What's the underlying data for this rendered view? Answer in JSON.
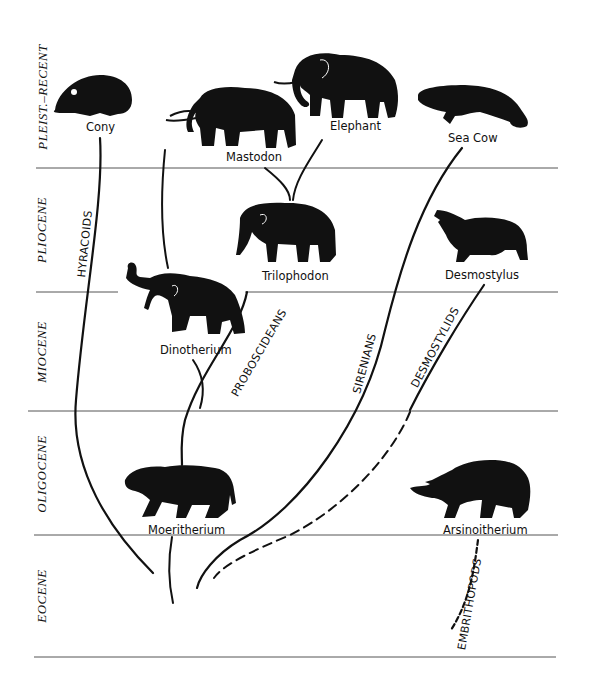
{
  "eras": [
    {
      "label": "PLEIST.–RECENT"
    },
    {
      "label": "PLIOCENE"
    },
    {
      "label": "MIOCENE"
    },
    {
      "label": "OLIGOCENE"
    },
    {
      "label": "EOCENE"
    }
  ],
  "animals": {
    "cony": "Cony",
    "mastodon": "Mastodon",
    "elephant": "Elephant",
    "sea_cow": "Sea Cow",
    "trilophodon": "Trilophodon",
    "desmostylus": "Desmostylus",
    "dinotherium": "Dinotherium",
    "moeritherium": "Moeritherium",
    "arsinoitherium": "Arsinoitherium"
  },
  "lineages": {
    "hyracoids": "HYRACOIDS",
    "proboscideans": "PROBOSCIDEANS",
    "sirenians": "SIRENIANS",
    "desmostylids": "DESMOSTYLIDS",
    "embrithopods": "EMBRITHOPODS"
  },
  "colors": {
    "ink": "#111111",
    "rule": "#555555",
    "background": "#ffffff"
  }
}
